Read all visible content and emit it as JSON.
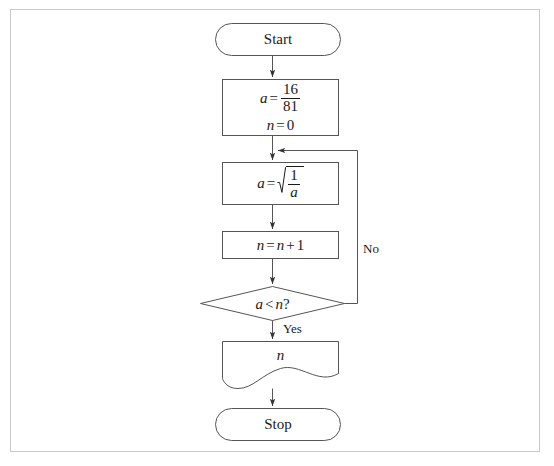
{
  "diagram": {
    "stroke_color": "#555555",
    "text_color": "#1a1a1a",
    "frame_color": "#c9c9c9",
    "background": "#ffffff"
  },
  "nodes": {
    "start": {
      "type": "terminal",
      "label": "Start"
    },
    "init": {
      "type": "process",
      "assign_var": "a",
      "equals": "=",
      "numerator": "16",
      "denominator": "81",
      "counter_line": "n = 0",
      "counter_var": "n",
      "counter_value": "0"
    },
    "iterate": {
      "type": "process",
      "assign_var": "a",
      "equals": "=",
      "radical_numerator": "1",
      "radical_denominator": "a"
    },
    "increment": {
      "type": "process",
      "expression": "n = n + 1",
      "lhs": "n",
      "equals": "=",
      "rhs_var": "n",
      "plus": "+",
      "rhs_value": "1"
    },
    "decision": {
      "type": "decision",
      "condition": "a < n ?",
      "left_var": "a",
      "relation": "<",
      "right_var": "n",
      "question_mark": "?"
    },
    "output": {
      "type": "document",
      "value": "n"
    },
    "stop": {
      "type": "terminal",
      "label": "Stop"
    }
  },
  "edges": {
    "start_to_init": {
      "label": ""
    },
    "init_to_iterate": {
      "label": ""
    },
    "iterate_to_increment": {
      "label": ""
    },
    "increment_to_decision": {
      "label": ""
    },
    "decision_yes": {
      "label": "Yes"
    },
    "decision_no": {
      "label": "No"
    },
    "output_to_stop": {
      "label": ""
    }
  }
}
